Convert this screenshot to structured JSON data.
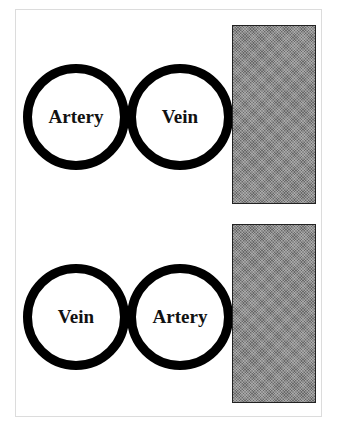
{
  "diagram": {
    "panels": [
      {
        "circles": [
          {
            "label": "Artery"
          },
          {
            "label": "Vein"
          }
        ],
        "block": {
          "fill": "#8c8c8c",
          "pattern": "stippled"
        }
      },
      {
        "circles": [
          {
            "label": "Vein"
          },
          {
            "label": "Artery"
          }
        ],
        "block": {
          "fill": "#8c8c8c",
          "pattern": "stippled"
        }
      }
    ],
    "colors": {
      "circle_stroke": "#000000",
      "block_border": "#222222",
      "frame_border": "#dcdcdc"
    }
  }
}
